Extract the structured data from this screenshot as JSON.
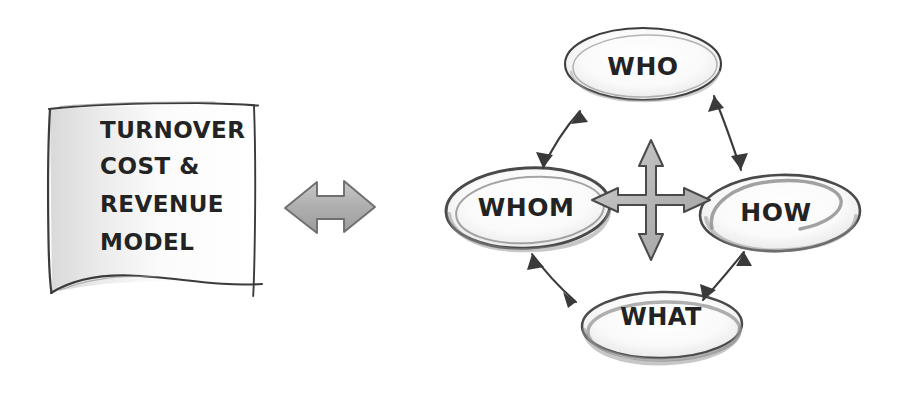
{
  "diagram": {
    "style": "hand-drawn sketch, pencil on white",
    "background_color": "#ffffff",
    "ink_color": "#232323",
    "shade_color": "#9a9a9a"
  },
  "model_box": {
    "name": "turnover-cost-revenue-model-box",
    "lines": [
      {
        "text": "TURNOVER"
      },
      {
        "text": "COST &"
      },
      {
        "text": "REVENUE"
      },
      {
        "text": "MODEL"
      }
    ]
  },
  "link_arrow": {
    "name": "model-to-framework-arrow",
    "label": "double-headed-horizontal-arrow",
    "direction": "bidirectional-horizontal",
    "fill_color": "#a8a8a8"
  },
  "center_arrow": {
    "name": "four-way-move-arrow",
    "label": "four-directional-arrow",
    "directions": "up-down-left-right",
    "fill_color": "#b4b4b4"
  },
  "nodes": [
    {
      "id": "who",
      "label": "WHO",
      "position": "top"
    },
    {
      "id": "whom",
      "label": "WHOM",
      "position": "left"
    },
    {
      "id": "how",
      "label": "HOW",
      "position": "right"
    },
    {
      "id": "what",
      "label": "WHAT",
      "position": "bottom"
    }
  ],
  "connectors": [
    {
      "id": "whom-who",
      "from": "WHOM",
      "to": "WHO",
      "kind": "bidirectional"
    },
    {
      "id": "who-how",
      "from": "WHO",
      "to": "HOW",
      "kind": "bidirectional"
    },
    {
      "id": "whom-what",
      "from": "WHOM",
      "to": "WHAT",
      "kind": "bidirectional"
    },
    {
      "id": "what-how",
      "from": "WHAT",
      "to": "HOW",
      "kind": "bidirectional"
    }
  ]
}
